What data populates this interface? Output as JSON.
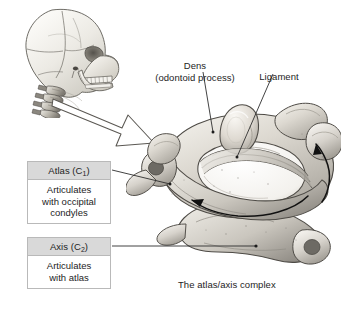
{
  "figure": {
    "caption": "The atlas/axis complex",
    "title": "",
    "background_color": "#ffffff",
    "bone_color": "#d8d5cf",
    "line_color": "#3a3a3a",
    "box_header_color": "#d9d9d9",
    "box_border_color": "#b9b9b9"
  },
  "labels": {
    "dens": "Dens\n(odontoid process)",
    "ligament": "Ligament"
  },
  "callouts": [
    {
      "id": "atlas",
      "title": "Atlas (C",
      "subscript": "1",
      "title_end": ")",
      "body": "Articulates\nwith occipital\ncondyles"
    },
    {
      "id": "axis",
      "title": "Axis (C",
      "subscript": "2",
      "title_end": ")",
      "body": "Articulates\nwith atlas"
    }
  ],
  "illustration": {
    "skull": "lateral-skull-with-cervical-spine",
    "pointer": "hollow-block-arrow",
    "main": "atlas-axis-complex-superior-oblique-view",
    "rotation_arrows": [
      "curved-arrow-left",
      "curved-arrow-up"
    ]
  }
}
